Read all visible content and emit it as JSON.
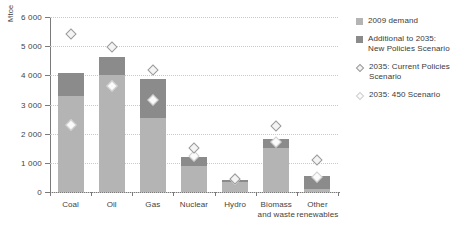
{
  "chart_data": {
    "type": "bar",
    "title": "",
    "xlabel": "",
    "ylabel": "Mtoe",
    "ylim": [
      0,
      6000
    ],
    "yticks": [
      0,
      1000,
      2000,
      3000,
      4000,
      5000,
      6000
    ],
    "ytick_labels": [
      "0",
      "1 000",
      "2 000",
      "3 000",
      "4 000",
      "5 000",
      "6 000"
    ],
    "grid": true,
    "legend_position": "right",
    "categories": [
      "Coal",
      "Oil",
      "Gas",
      "Nuclear",
      "Hydro",
      "Biomass\nand waste",
      "Other\nrenewables"
    ],
    "series": [
      {
        "name": "2009 demand",
        "type": "bar-segment",
        "color": "#b4b4b4",
        "values": [
          3300,
          4000,
          2540,
          890,
          330,
          1500,
          120
        ]
      },
      {
        "name": "Additional to 2035: New Policies Scenario",
        "type": "bar-segment",
        "color": "#8b8b8b",
        "values": [
          790,
          620,
          1330,
          310,
          80,
          330,
          430
        ]
      },
      {
        "name": "2035: Current Policies Scenario",
        "type": "marker-diamond",
        "color": "#f4f4f4",
        "values": [
          5410,
          4980,
          4190,
          1510,
          450,
          2270,
          1110
        ]
      },
      {
        "name": "2035: 450 Scenario",
        "type": "marker-diamond",
        "color": "#fbfbfb",
        "values": [
          2290,
          3650,
          3150,
          1230,
          440,
          1730,
          500
        ]
      }
    ],
    "totals_new_policies": [
      4090,
      4620,
      3870,
      1200,
      410,
      1830,
      550
    ]
  },
  "legend": {
    "items": [
      {
        "label": "2009 demand",
        "marker": "square-light"
      },
      {
        "label": "Additional to 2035:\nNew Policies Scenario",
        "marker": "square-dark"
      },
      {
        "label": "2035: Current Policies\nScenario",
        "marker": "diamond-cps"
      },
      {
        "label": "2035: 450 Scenario",
        "marker": "diamond-450"
      }
    ]
  },
  "axis": {
    "y_title": "Mtoe"
  }
}
